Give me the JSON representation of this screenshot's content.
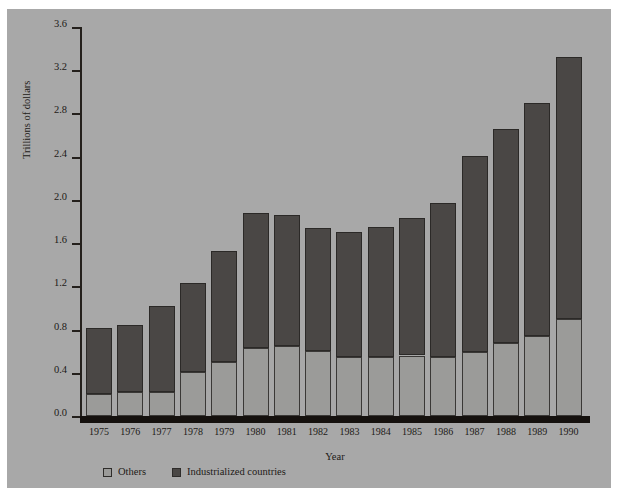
{
  "chart_data": {
    "type": "bar",
    "subtype": "stacked",
    "title": "",
    "xlabel": "Year",
    "ylabel": "Trillions of dollars",
    "ylim": [
      0.0,
      3.6
    ],
    "yticks": [
      "0.0",
      "0.4",
      "0.8",
      "1.2",
      "1.6",
      "2.0",
      "2.4",
      "2.8",
      "3.2",
      "3.6"
    ],
    "ytick_values": [
      0.0,
      0.4,
      0.8,
      1.2,
      1.6,
      2.0,
      2.4,
      2.8,
      3.2,
      3.6
    ],
    "grid": false,
    "legend_position": "bottom-left",
    "categories": [
      "1975",
      "1976",
      "1977",
      "1978",
      "1979",
      "1980",
      "1981",
      "1982",
      "1983",
      "1984",
      "1985",
      "1986",
      "1987",
      "1988",
      "1989",
      "1990"
    ],
    "series": [
      {
        "name": "Others",
        "color": "#9b9b99",
        "values": [
          0.2,
          0.22,
          0.22,
          0.41,
          0.5,
          0.63,
          0.65,
          0.6,
          0.55,
          0.55,
          0.56,
          0.55,
          0.59,
          0.68,
          0.74,
          0.9
        ]
      },
      {
        "name": "Industrialized countries",
        "color": "#4a4745",
        "values": [
          0.61,
          0.62,
          0.8,
          0.82,
          1.03,
          1.25,
          1.21,
          1.14,
          1.15,
          1.2,
          1.27,
          1.42,
          1.82,
          1.98,
          2.16,
          2.42
        ]
      }
    ],
    "totals": [
      0.81,
      0.84,
      1.02,
      1.23,
      1.53,
      1.88,
      1.86,
      1.74,
      1.7,
      1.75,
      1.83,
      1.97,
      2.41,
      2.66,
      2.9,
      3.32
    ]
  },
  "legend": {
    "items": [
      {
        "label": "Others",
        "color": "#9b9b99"
      },
      {
        "label": "Industrialized countries",
        "color": "#4a4745"
      }
    ]
  }
}
